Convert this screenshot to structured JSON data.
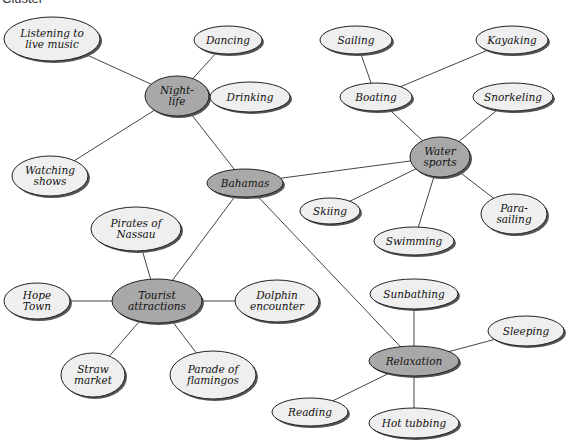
{
  "title": "Cluster",
  "colors": {
    "hub_fill": "#a8a8a8",
    "leaf_fill": "#efefef",
    "stroke": "#222222",
    "edge": "#444444"
  },
  "nodes": [
    {
      "id": "listening",
      "lines": [
        "Listening to",
        "live music"
      ],
      "x": 52,
      "y": 39,
      "rx": 48,
      "ry": 22,
      "hub": false
    },
    {
      "id": "dancing",
      "lines": [
        "Dancing"
      ],
      "x": 228,
      "y": 40,
      "rx": 34,
      "ry": 14,
      "hub": false
    },
    {
      "id": "nightlife",
      "lines": [
        "Night-",
        "life"
      ],
      "x": 177,
      "y": 96,
      "rx": 32,
      "ry": 20,
      "hub": true
    },
    {
      "id": "drinking",
      "lines": [
        "Drinking"
      ],
      "x": 250,
      "y": 97,
      "rx": 40,
      "ry": 15,
      "hub": false
    },
    {
      "id": "watching",
      "lines": [
        "Watching",
        "shows"
      ],
      "x": 50,
      "y": 176,
      "rx": 38,
      "ry": 20,
      "hub": false
    },
    {
      "id": "bahamas",
      "lines": [
        "Bahamas"
      ],
      "x": 245,
      "y": 183,
      "rx": 38,
      "ry": 14,
      "hub": true
    },
    {
      "id": "sailing",
      "lines": [
        "Sailing"
      ],
      "x": 356,
      "y": 40,
      "rx": 36,
      "ry": 14,
      "hub": false
    },
    {
      "id": "kayaking",
      "lines": [
        "Kayaking"
      ],
      "x": 512,
      "y": 40,
      "rx": 36,
      "ry": 14,
      "hub": false
    },
    {
      "id": "boating",
      "lines": [
        "Boating"
      ],
      "x": 376,
      "y": 97,
      "rx": 36,
      "ry": 14,
      "hub": false
    },
    {
      "id": "snorkeling",
      "lines": [
        "Snorkeling"
      ],
      "x": 513,
      "y": 97,
      "rx": 40,
      "ry": 14,
      "hub": false
    },
    {
      "id": "watersports",
      "lines": [
        "Water",
        "sports"
      ],
      "x": 440,
      "y": 157,
      "rx": 30,
      "ry": 20,
      "hub": true
    },
    {
      "id": "skiing",
      "lines": [
        "Skiing"
      ],
      "x": 330,
      "y": 211,
      "rx": 30,
      "ry": 13,
      "hub": false
    },
    {
      "id": "swimming",
      "lines": [
        "Swimming"
      ],
      "x": 414,
      "y": 241,
      "rx": 40,
      "ry": 14,
      "hub": false
    },
    {
      "id": "parasailing",
      "lines": [
        "Para-",
        "sailing"
      ],
      "x": 514,
      "y": 214,
      "rx": 33,
      "ry": 20,
      "hub": false
    },
    {
      "id": "pirates",
      "lines": [
        "Pirates of",
        "Nassau"
      ],
      "x": 136,
      "y": 229,
      "rx": 45,
      "ry": 22,
      "hub": false
    },
    {
      "id": "hopetown",
      "lines": [
        "Hope",
        "Town"
      ],
      "x": 37,
      "y": 301,
      "rx": 33,
      "ry": 18,
      "hub": false
    },
    {
      "id": "tourist",
      "lines": [
        "Tourist",
        "attractions"
      ],
      "x": 157,
      "y": 301,
      "rx": 45,
      "ry": 22,
      "hub": true
    },
    {
      "id": "dolphin",
      "lines": [
        "Dolphin",
        "encounter"
      ],
      "x": 277,
      "y": 301,
      "rx": 42,
      "ry": 21,
      "hub": false
    },
    {
      "id": "straw",
      "lines": [
        "Straw",
        "market"
      ],
      "x": 93,
      "y": 375,
      "rx": 32,
      "ry": 22,
      "hub": false
    },
    {
      "id": "parade",
      "lines": [
        "Parade of",
        "flamingos"
      ],
      "x": 213,
      "y": 375,
      "rx": 43,
      "ry": 24,
      "hub": false
    },
    {
      "id": "sunbathing",
      "lines": [
        "Sunbathing"
      ],
      "x": 414,
      "y": 294,
      "rx": 44,
      "ry": 15,
      "hub": false
    },
    {
      "id": "sleeping",
      "lines": [
        "Sleeping"
      ],
      "x": 526,
      "y": 331,
      "rx": 38,
      "ry": 15,
      "hub": false
    },
    {
      "id": "relaxation",
      "lines": [
        "Relaxation"
      ],
      "x": 414,
      "y": 361,
      "rx": 45,
      "ry": 15,
      "hub": true
    },
    {
      "id": "reading",
      "lines": [
        "Reading"
      ],
      "x": 310,
      "y": 412,
      "rx": 38,
      "ry": 14,
      "hub": false
    },
    {
      "id": "hottubbing",
      "lines": [
        "Hot tubbing"
      ],
      "x": 414,
      "y": 423,
      "rx": 45,
      "ry": 15,
      "hub": false
    }
  ],
  "edges": [
    [
      "listening",
      "nightlife"
    ],
    [
      "dancing",
      "nightlife"
    ],
    [
      "drinking",
      "nightlife"
    ],
    [
      "watching",
      "nightlife"
    ],
    [
      "nightlife",
      "bahamas"
    ],
    [
      "sailing",
      "boating"
    ],
    [
      "kayaking",
      "boating"
    ],
    [
      "boating",
      "watersports"
    ],
    [
      "snorkeling",
      "watersports"
    ],
    [
      "bahamas",
      "watersports"
    ],
    [
      "skiing",
      "watersports"
    ],
    [
      "swimming",
      "watersports"
    ],
    [
      "parasailing",
      "watersports"
    ],
    [
      "bahamas",
      "tourist"
    ],
    [
      "pirates",
      "tourist"
    ],
    [
      "hopetown",
      "tourist"
    ],
    [
      "dolphin",
      "tourist"
    ],
    [
      "straw",
      "tourist"
    ],
    [
      "parade",
      "tourist"
    ],
    [
      "bahamas",
      "relaxation"
    ],
    [
      "sunbathing",
      "relaxation"
    ],
    [
      "sleeping",
      "relaxation"
    ],
    [
      "reading",
      "relaxation"
    ],
    [
      "hottubbing",
      "relaxation"
    ]
  ]
}
